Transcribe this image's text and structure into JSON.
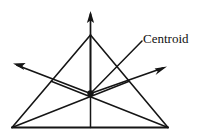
{
  "figure": {
    "name": "centroid-of-triangle-diagram",
    "background_color": "#ffffff",
    "stroke_color": "#151515",
    "text_color": "#111111",
    "width": 206,
    "height": 138
  },
  "labels": {
    "centroid": "Centroid"
  },
  "geometry": {
    "triangle": {
      "apex": [
        90.5,
        35
      ],
      "bottom_left": [
        12,
        127.5
      ],
      "bottom_right": [
        168,
        127.5
      ]
    },
    "centroid_point": [
      90.5,
      93.5
    ],
    "centroid_dot_radius": 3.2,
    "midpoints": {
      "base": [
        90.5,
        127.5
      ],
      "left_side": [
        51.2,
        81.2
      ],
      "right_side": [
        129.2,
        81.2
      ]
    },
    "arrows": {
      "up": {
        "from": [
          90.5,
          93.5
        ],
        "to": [
          90.5,
          11
        ]
      },
      "up_left": {
        "from": [
          90.5,
          93.5
        ],
        "to": [
          13,
          63.5
        ]
      },
      "up_right": {
        "from": [
          90.5,
          93.5
        ],
        "to": [
          167,
          66.5
        ]
      }
    },
    "leader_line": {
      "from": [
        90.5,
        93.5
      ],
      "to": [
        142,
        41
      ]
    },
    "label_position": [
      143,
      32
    ]
  }
}
